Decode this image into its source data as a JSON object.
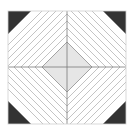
{
  "figure": {
    "colors": {
      "background": "#ffffff",
      "tile_fill": "#ffffff",
      "tile_border": "#cfcfcf",
      "corner_triangle": "#333333",
      "stripe": "#bdbdbd",
      "diamond_fill": "#e6e6e6",
      "diamond_border": "#9a9a9a",
      "cross_line": "#7a7a7a"
    },
    "tile": {
      "x": 8,
      "y": 11,
      "width": 118,
      "height": 113
    },
    "center": {
      "x": 67,
      "y": 67
    },
    "diamond_half_size": 25,
    "corner_triangle_leg": 26,
    "stripe_count_per_side": 8,
    "stripe_spacing": 7
  }
}
